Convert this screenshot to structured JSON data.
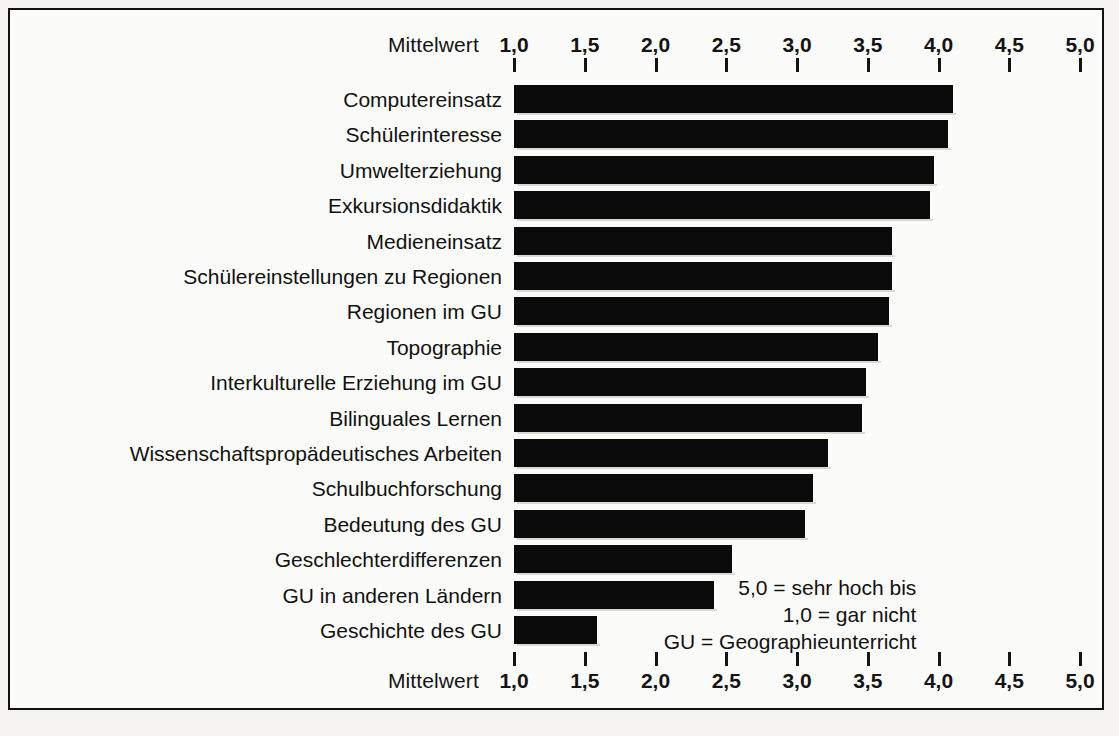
{
  "chart_data": {
    "type": "bar",
    "orientation": "horizontal",
    "title": "",
    "xlabel": "Mittelwert",
    "ylabel": "",
    "xlim": [
      1.0,
      5.0
    ],
    "grid": false,
    "legend_position": "inside-bottom-right",
    "tick_labels": [
      "1,0",
      "1,5",
      "2,0",
      "2,5",
      "3,0",
      "3,5",
      "4,0",
      "4,5",
      "5,0"
    ],
    "tick_values": [
      1.0,
      1.5,
      2.0,
      2.5,
      3.0,
      3.5,
      4.0,
      4.5,
      5.0
    ],
    "axis_caption_top": "Mittelwert",
    "axis_caption_bottom": "Mittelwert",
    "categories": [
      "Computereinsatz",
      "Schülerinteresse",
      "Umwelterziehung",
      "Exkursionsdidaktik",
      "Medieneinsatz",
      "Schülereinstellungen zu Regionen",
      "Regionen im GU",
      "Topographie",
      "Interkulturelle Erziehung im GU",
      "Bilinguales Lernen",
      "Wissenschaftspropädeutisches Arbeiten",
      "Schulbuchforschung",
      "Bedeutung des GU",
      "Geschlechterdifferenzen",
      "GU in anderen Ländern",
      "Geschichte des GU"
    ],
    "values": [
      4.1,
      4.07,
      3.97,
      3.94,
      3.67,
      3.67,
      3.65,
      3.57,
      3.49,
      3.46,
      3.22,
      3.11,
      3.06,
      2.54,
      2.41,
      1.59
    ],
    "annotations": [
      "5,0 = sehr hoch bis",
      "1,0 = gar nicht",
      "GU = Geographieunterricht"
    ],
    "bar_color": "#0b0b0b",
    "background_color": "#fbfbf9"
  }
}
